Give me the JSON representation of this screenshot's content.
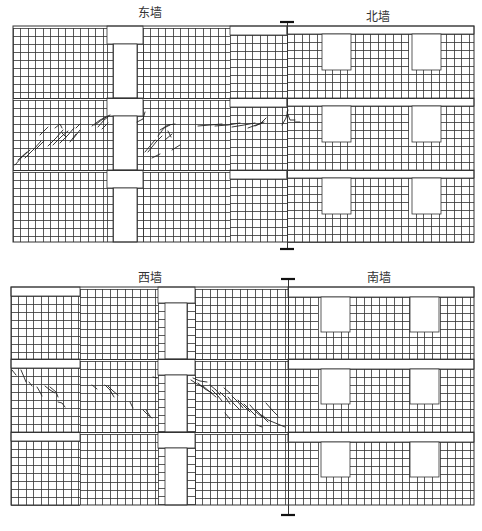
{
  "figure": {
    "width": 482,
    "height": 531,
    "line_color": "#333333",
    "crack_color": "#222222"
  },
  "panels": [
    {
      "id": "top",
      "x0": 13,
      "x1": 474,
      "y0": 26,
      "y1": 242,
      "divider_x": 287,
      "tick_top_y": 22,
      "tick_bottom_y": 249,
      "left_label": "东墙",
      "left_label_x": 150,
      "left_label_y": 3,
      "right_label": "北墙",
      "right_label_x": 378,
      "right_label_y": 7,
      "stories": [
        {
          "y0": 26,
          "y1": 98
        },
        {
          "y0": 98,
          "y1": 170
        },
        {
          "y0": 170,
          "y1": 242
        }
      ],
      "left_wall": {
        "type": "east",
        "col_w": 7.5,
        "row_h": 8,
        "door": {
          "x0": 113,
          "x1": 137
        },
        "door_head_x0": 107,
        "door_head_x1": 143,
        "head_h": 18
      },
      "right_wall": {
        "type": "north",
        "col_w": 7.6,
        "row_h": 8,
        "windows": [
          {
            "x0": 322,
            "x1": 351
          },
          {
            "x0": 412,
            "x1": 441
          }
        ],
        "band_h": 8
      }
    },
    {
      "id": "bottom",
      "x0": 11,
      "x1": 474,
      "y0": 287,
      "y1": 505,
      "divider_x": 288,
      "tick_top_y": 279,
      "tick_bottom_y": 515,
      "left_label": "西墙",
      "left_label_x": 150,
      "left_label_y": 268,
      "right_label": "南墙",
      "right_label_x": 379,
      "right_label_y": 268,
      "stories": [
        {
          "y0": 287,
          "y1": 359
        },
        {
          "y0": 359,
          "y1": 432
        },
        {
          "y0": 432,
          "y1": 505
        }
      ],
      "left_wall": {
        "type": "west",
        "col_w": 7.5,
        "row_h": 8,
        "door": {
          "x0": 165,
          "x1": 187
        },
        "head_h": 16,
        "window_left_x1": 80,
        "window_right_x0": 158,
        "window_right2_x0": 195
      },
      "right_wall": {
        "type": "south",
        "col_w": 7.6,
        "row_h": 8,
        "windows": [
          {
            "x0": 321,
            "x1": 350
          },
          {
            "x0": 410,
            "x1": 439
          }
        ],
        "band_h": 10
      }
    }
  ],
  "labels": [
    {
      "text": "东墙",
      "x": 150,
      "y": 3
    },
    {
      "text": "北墙",
      "x": 378,
      "y": 7
    },
    {
      "text": "西墙",
      "x": 150,
      "y": 268
    },
    {
      "text": "南墙",
      "x": 379,
      "y": 268
    }
  ],
  "cracks": [
    {
      "wall": "东墙",
      "pts": [
        [
          15,
          165
        ],
        [
          22,
          157
        ],
        [
          30,
          150
        ]
      ]
    },
    {
      "wall": "东墙",
      "pts": [
        [
          18,
          160
        ],
        [
          27,
          152
        ]
      ]
    },
    {
      "wall": "东墙",
      "pts": [
        [
          25,
          158
        ],
        [
          34,
          149
        ],
        [
          41,
          141
        ]
      ]
    },
    {
      "wall": "东墙",
      "pts": [
        [
          35,
          150
        ],
        [
          44,
          141
        ]
      ]
    },
    {
      "wall": "东墙",
      "pts": [
        [
          40,
          135
        ],
        [
          48,
          127
        ]
      ]
    },
    {
      "wall": "东墙",
      "pts": [
        [
          48,
          146
        ],
        [
          56,
          138
        ],
        [
          63,
          130
        ]
      ]
    },
    {
      "wall": "东墙",
      "pts": [
        [
          55,
          128
        ],
        [
          60,
          124
        ],
        [
          62,
          128
        ]
      ]
    },
    {
      "wall": "东墙",
      "pts": [
        [
          53,
          145
        ],
        [
          62,
          136
        ],
        [
          68,
          131
        ]
      ]
    },
    {
      "wall": "东墙",
      "pts": [
        [
          60,
          143
        ],
        [
          68,
          135
        ],
        [
          74,
          128
        ]
      ]
    },
    {
      "wall": "东墙",
      "pts": [
        [
          62,
          133
        ],
        [
          66,
          137
        ]
      ]
    },
    {
      "wall": "东墙",
      "pts": [
        [
          70,
          142
        ],
        [
          76,
          134
        ]
      ]
    },
    {
      "wall": "东墙",
      "pts": [
        [
          73,
          139
        ],
        [
          80,
          130
        ]
      ]
    },
    {
      "wall": "东墙",
      "pts": [
        [
          76,
          128
        ],
        [
          80,
          124
        ]
      ]
    },
    {
      "wall": "东墙",
      "pts": [
        [
          92,
          126
        ],
        [
          100,
          120
        ],
        [
          106,
          117
        ]
      ]
    },
    {
      "wall": "东墙",
      "pts": [
        [
          95,
          125
        ],
        [
          103,
          119
        ],
        [
          110,
          115
        ]
      ]
    },
    {
      "wall": "东墙",
      "pts": [
        [
          98,
          127
        ],
        [
          104,
          120
        ],
        [
          108,
          117
        ]
      ]
    },
    {
      "wall": "东墙",
      "pts": [
        [
          102,
          129
        ],
        [
          108,
          123
        ]
      ]
    },
    {
      "wall": "东墙",
      "pts": [
        [
          137,
          122
        ],
        [
          143,
          119
        ],
        [
          145,
          112
        ]
      ]
    },
    {
      "wall": "东墙",
      "pts": [
        [
          145,
          152
        ],
        [
          150,
          146
        ],
        [
          155,
          140
        ]
      ]
    },
    {
      "wall": "东墙",
      "pts": [
        [
          148,
          152
        ],
        [
          156,
          142
        ],
        [
          162,
          136
        ]
      ]
    },
    {
      "wall": "东墙",
      "pts": [
        [
          158,
          136
        ],
        [
          164,
          128
        ],
        [
          170,
          125
        ]
      ]
    },
    {
      "wall": "东墙",
      "pts": [
        [
          160,
          130
        ],
        [
          168,
          125
        ],
        [
          175,
          124
        ]
      ]
    },
    {
      "wall": "东墙",
      "pts": [
        [
          165,
          140
        ],
        [
          172,
          134
        ]
      ]
    },
    {
      "wall": "东墙",
      "pts": [
        [
          168,
          131
        ],
        [
          171,
          137
        ]
      ]
    },
    {
      "wall": "东墙",
      "pts": [
        [
          152,
          158
        ],
        [
          160,
          154
        ]
      ]
    },
    {
      "wall": "东墙",
      "pts": [
        [
          172,
          150
        ],
        [
          180,
          145
        ]
      ]
    },
    {
      "wall": "东墙",
      "pts": [
        [
          198,
          126
        ],
        [
          210,
          125
        ],
        [
          222,
          124
        ]
      ]
    },
    {
      "wall": "东墙",
      "pts": [
        [
          215,
          126
        ],
        [
          228,
          125
        ],
        [
          240,
          123
        ]
      ]
    },
    {
      "wall": "东墙",
      "pts": [
        [
          232,
          127
        ],
        [
          244,
          125
        ],
        [
          255,
          123
        ]
      ]
    },
    {
      "wall": "东墙",
      "pts": [
        [
          248,
          128
        ],
        [
          256,
          125
        ],
        [
          264,
          122
        ]
      ]
    },
    {
      "wall": "东墙",
      "pts": [
        [
          255,
          126
        ],
        [
          262,
          123
        ]
      ]
    },
    {
      "wall": "东墙",
      "pts": [
        [
          260,
          124
        ],
        [
          266,
          118
        ]
      ]
    },
    {
      "wall": "东墙",
      "pts": [
        [
          282,
          125
        ],
        [
          286,
          118
        ],
        [
          288,
          110
        ]
      ]
    },
    {
      "wall": "东墙",
      "pts": [
        [
          287,
          112
        ],
        [
          290,
          120
        ],
        [
          295,
          120
        ]
      ]
    },
    {
      "wall": "东墙",
      "pts": [
        [
          295,
          122
        ],
        [
          300,
          122
        ]
      ]
    },
    {
      "wall": "西墙",
      "pts": [
        [
          12,
          370
        ],
        [
          16,
          375
        ]
      ]
    },
    {
      "wall": "西墙",
      "pts": [
        [
          21,
          370
        ],
        [
          24,
          377
        ],
        [
          26,
          382
        ]
      ]
    },
    {
      "wall": "西墙",
      "pts": [
        [
          29,
          382
        ],
        [
          32,
          386
        ]
      ]
    },
    {
      "wall": "西墙",
      "pts": [
        [
          37,
          387
        ],
        [
          40,
          392
        ],
        [
          42,
          396
        ]
      ]
    },
    {
      "wall": "西墙",
      "pts": [
        [
          45,
          386
        ],
        [
          50,
          390
        ],
        [
          55,
          393
        ]
      ]
    },
    {
      "wall": "西墙",
      "pts": [
        [
          50,
          387
        ],
        [
          56,
          392
        ],
        [
          58,
          397
        ]
      ]
    },
    {
      "wall": "西墙",
      "pts": [
        [
          58,
          402
        ],
        [
          62,
          403
        ],
        [
          65,
          407
        ]
      ]
    },
    {
      "wall": "西墙",
      "pts": [
        [
          92,
          385
        ],
        [
          97,
          389
        ]
      ]
    },
    {
      "wall": "西墙",
      "pts": [
        [
          105,
          385
        ],
        [
          110,
          390
        ],
        [
          114,
          397
        ]
      ]
    },
    {
      "wall": "西墙",
      "pts": [
        [
          108,
          386
        ],
        [
          113,
          391
        ],
        [
          118,
          395
        ]
      ]
    },
    {
      "wall": "西墙",
      "pts": [
        [
          130,
          402
        ],
        [
          133,
          408
        ]
      ]
    },
    {
      "wall": "西墙",
      "pts": [
        [
          143,
          410
        ],
        [
          148,
          415
        ],
        [
          152,
          418
        ]
      ]
    },
    {
      "wall": "西墙",
      "pts": [
        [
          146,
          410
        ],
        [
          150,
          416
        ]
      ]
    },
    {
      "wall": "西墙",
      "pts": [
        [
          153,
          377
        ],
        [
          157,
          378
        ]
      ]
    },
    {
      "wall": "西墙",
      "pts": [
        [
          191,
          380
        ],
        [
          197,
          384
        ],
        [
          203,
          387
        ]
      ]
    },
    {
      "wall": "西墙",
      "pts": [
        [
          193,
          378
        ],
        [
          200,
          381
        ],
        [
          207,
          382
        ]
      ]
    },
    {
      "wall": "西墙",
      "pts": [
        [
          198,
          383
        ],
        [
          205,
          389
        ],
        [
          212,
          393
        ]
      ]
    },
    {
      "wall": "西墙",
      "pts": [
        [
          203,
          386
        ],
        [
          210,
          392
        ],
        [
          216,
          397
        ]
      ]
    },
    {
      "wall": "西墙",
      "pts": [
        [
          210,
          385
        ],
        [
          216,
          390
        ],
        [
          220,
          395
        ]
      ]
    },
    {
      "wall": "西墙",
      "pts": [
        [
          212,
          390
        ],
        [
          218,
          396
        ],
        [
          222,
          401
        ]
      ]
    },
    {
      "wall": "西墙",
      "pts": [
        [
          220,
          392
        ],
        [
          226,
          398
        ],
        [
          230,
          404
        ]
      ]
    },
    {
      "wall": "西墙",
      "pts": [
        [
          224,
          388
        ],
        [
          230,
          393
        ]
      ]
    },
    {
      "wall": "西墙",
      "pts": [
        [
          228,
          397
        ],
        [
          234,
          404
        ],
        [
          240,
          410
        ]
      ]
    },
    {
      "wall": "西墙",
      "pts": [
        [
          232,
          396
        ],
        [
          238,
          402
        ],
        [
          243,
          408
        ]
      ]
    },
    {
      "wall": "西墙",
      "pts": [
        [
          238,
          400
        ],
        [
          244,
          406
        ],
        [
          250,
          412
        ]
      ]
    },
    {
      "wall": "西墙",
      "pts": [
        [
          244,
          404
        ],
        [
          250,
          410
        ],
        [
          256,
          416
        ]
      ]
    },
    {
      "wall": "西墙",
      "pts": [
        [
          250,
          405
        ],
        [
          256,
          412
        ],
        [
          262,
          417
        ]
      ]
    },
    {
      "wall": "西墙",
      "pts": [
        [
          256,
          410
        ],
        [
          262,
          416
        ],
        [
          268,
          422
        ]
      ]
    },
    {
      "wall": "西墙",
      "pts": [
        [
          262,
          415
        ],
        [
          268,
          420
        ],
        [
          285,
          427
        ]
      ]
    },
    {
      "wall": "西墙",
      "pts": [
        [
          266,
          403
        ],
        [
          272,
          410
        ]
      ]
    },
    {
      "wall": "西墙",
      "pts": [
        [
          272,
          410
        ],
        [
          278,
          416
        ]
      ]
    },
    {
      "wall": "西墙",
      "pts": [
        [
          225,
          413
        ],
        [
          230,
          419
        ]
      ]
    },
    {
      "wall": "西墙",
      "pts": [
        [
          257,
          425
        ],
        [
          262,
          427
        ]
      ]
    }
  ]
}
